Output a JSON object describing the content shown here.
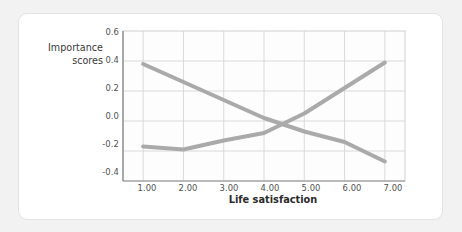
{
  "figure": {
    "background_color": "#f2f2f2",
    "card_color": "#ffffff",
    "card_border_color": "#e3e3e3"
  },
  "chart_data": {
    "type": "line",
    "title": "",
    "subtitle": "",
    "xlabel": "Life satisfaction",
    "ylabel": "Importance scores",
    "ylabel_line1": "Importance",
    "ylabel_line2": "scores",
    "x": [
      1,
      2,
      3,
      4,
      5,
      6,
      7
    ],
    "xtick_labels": [
      "1.00",
      "2.00",
      "3.00",
      "4.00",
      "5.00",
      "6.00",
      "7.00"
    ],
    "ytick_labels": [
      "0.6",
      "0.4",
      "0.2",
      "0.0",
      "-0.2",
      "-0.4"
    ],
    "ytick_values": [
      0.6,
      0.4,
      0.2,
      0.0,
      -0.2,
      -0.4
    ],
    "xlim": [
      0.5,
      7.5
    ],
    "ylim": [
      -0.4,
      0.6
    ],
    "grid": true,
    "grid_color": "#d6d6d6",
    "legend": "inline-annotations",
    "legend_position": "inline",
    "series": [
      {
        "name": "Money",
        "label": "Money",
        "color": "#aaaaaa",
        "line_width": 4,
        "values": [
          0.38,
          0.26,
          0.14,
          0.02,
          -0.07,
          -0.14,
          -0.27
        ]
      },
      {
        "name": "Love",
        "label": "Love",
        "color": "#aaaaaa",
        "line_width": 4,
        "values": [
          -0.17,
          -0.19,
          -0.13,
          -0.08,
          0.05,
          0.22,
          0.39
        ]
      }
    ],
    "annotations": [
      {
        "text": "Money",
        "x": 2.9,
        "y": 0.31
      },
      {
        "text": "Love",
        "x": 5.45,
        "y": 0.33
      }
    ],
    "crossing_point": {
      "x": 4.3,
      "y": -0.03
    }
  }
}
